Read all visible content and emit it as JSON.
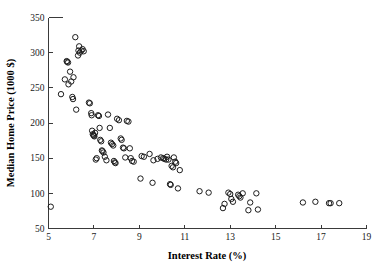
{
  "chart_data": {
    "type": "scatter",
    "title": "",
    "xlabel": "Interest Rate (%)",
    "ylabel": "Median Home Price (1000 $)",
    "xlim": [
      5,
      19
    ],
    "ylim": [
      50,
      350
    ],
    "xticks": [
      5,
      7,
      9,
      11,
      13,
      15,
      17,
      19
    ],
    "yticks": [
      50,
      100,
      150,
      200,
      250,
      300,
      350
    ],
    "xtick_labels": [
      "5",
      "7",
      "9",
      "11",
      "13",
      "15",
      "17",
      "19"
    ],
    "ytick_labels": [
      "50",
      "100",
      "150",
      "200",
      "250",
      "300",
      "350"
    ],
    "grid": false,
    "legend": null,
    "marker": "open-circle",
    "marker_color": "#1c1c1c",
    "points": [
      [
        5.1,
        81
      ],
      [
        5.55,
        241
      ],
      [
        5.72,
        262
      ],
      [
        5.8,
        288
      ],
      [
        5.82,
        287
      ],
      [
        5.86,
        286
      ],
      [
        5.88,
        255
      ],
      [
        5.95,
        273
      ],
      [
        6.0,
        259
      ],
      [
        6.05,
        237
      ],
      [
        6.08,
        234
      ],
      [
        6.1,
        265
      ],
      [
        6.18,
        322
      ],
      [
        6.22,
        219
      ],
      [
        6.3,
        296
      ],
      [
        6.32,
        303
      ],
      [
        6.35,
        309
      ],
      [
        6.38,
        300
      ],
      [
        6.45,
        303
      ],
      [
        6.5,
        305
      ],
      [
        6.55,
        302
      ],
      [
        6.78,
        229
      ],
      [
        6.82,
        228
      ],
      [
        6.88,
        214
      ],
      [
        6.9,
        211
      ],
      [
        6.92,
        189
      ],
      [
        6.95,
        184
      ],
      [
        6.98,
        183
      ],
      [
        7.0,
        182
      ],
      [
        7.02,
        181
      ],
      [
        7.05,
        186
      ],
      [
        7.08,
        148
      ],
      [
        7.12,
        150
      ],
      [
        7.18,
        211
      ],
      [
        7.22,
        210
      ],
      [
        7.25,
        193
      ],
      [
        7.28,
        176
      ],
      [
        7.32,
        174
      ],
      [
        7.35,
        161
      ],
      [
        7.38,
        160
      ],
      [
        7.42,
        158
      ],
      [
        7.48,
        152
      ],
      [
        7.55,
        147
      ],
      [
        7.62,
        212
      ],
      [
        7.7,
        193
      ],
      [
        7.75,
        172
      ],
      [
        7.8,
        170
      ],
      [
        7.85,
        168
      ],
      [
        7.88,
        146
      ],
      [
        7.92,
        144
      ],
      [
        7.95,
        143
      ],
      [
        8.02,
        206
      ],
      [
        8.1,
        204
      ],
      [
        8.18,
        178
      ],
      [
        8.22,
        176
      ],
      [
        8.28,
        165
      ],
      [
        8.32,
        164
      ],
      [
        8.38,
        151
      ],
      [
        8.45,
        203
      ],
      [
        8.52,
        202
      ],
      [
        8.58,
        164
      ],
      [
        8.62,
        150
      ],
      [
        8.68,
        146
      ],
      [
        8.75,
        145
      ],
      [
        9.05,
        121
      ],
      [
        9.1,
        153
      ],
      [
        9.2,
        152
      ],
      [
        9.45,
        156
      ],
      [
        9.58,
        115
      ],
      [
        9.62,
        147
      ],
      [
        9.8,
        149
      ],
      [
        9.95,
        151
      ],
      [
        10.05,
        150
      ],
      [
        10.1,
        149
      ],
      [
        10.18,
        148
      ],
      [
        10.22,
        152
      ],
      [
        10.28,
        148
      ],
      [
        10.35,
        113
      ],
      [
        10.38,
        112
      ],
      [
        10.42,
        139
      ],
      [
        10.48,
        137
      ],
      [
        10.52,
        151
      ],
      [
        10.58,
        145
      ],
      [
        10.62,
        143
      ],
      [
        10.7,
        107
      ],
      [
        10.78,
        133
      ],
      [
        11.65,
        103
      ],
      [
        12.05,
        101
      ],
      [
        12.68,
        79
      ],
      [
        12.75,
        85
      ],
      [
        12.92,
        101
      ],
      [
        13.0,
        99
      ],
      [
        13.05,
        92
      ],
      [
        13.12,
        88
      ],
      [
        13.35,
        98
      ],
      [
        13.4,
        96
      ],
      [
        13.45,
        94
      ],
      [
        13.55,
        100
      ],
      [
        13.8,
        76
      ],
      [
        13.88,
        87
      ],
      [
        14.15,
        100
      ],
      [
        14.22,
        77
      ],
      [
        16.2,
        87
      ],
      [
        16.75,
        88
      ],
      [
        17.35,
        86
      ],
      [
        17.42,
        86
      ],
      [
        17.8,
        86
      ]
    ]
  }
}
